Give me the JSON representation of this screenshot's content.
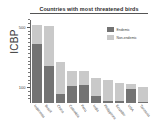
{
  "source": {
    "label": "ICBP"
  },
  "chart_data": {
    "type": "bar",
    "title": "Countries with most threatened birds",
    "xlabel": "",
    "ylabel": "",
    "ylim": [
      0,
      550
    ],
    "yticks": [
      100,
      500
    ],
    "ytick_labels": [
      "100",
      "500"
    ],
    "grid": false,
    "stacked": true,
    "legend_position": "top-right",
    "categories": [
      "Indonesia",
      "Brazil",
      "China",
      "Colombia",
      "Peru",
      "India",
      "Philippines",
      "Ecuador",
      "USA",
      "Tanzania"
    ],
    "series": [
      {
        "name": "Endemic",
        "color": "#737373",
        "values": [
          390,
          245,
          60,
          110,
          120,
          45,
          12,
          15,
          95,
          5
        ]
      },
      {
        "name": "Non-endemic",
        "color": "#c9c9c9",
        "values": [
          130,
          265,
          215,
          100,
          95,
          120,
          140,
          120,
          30,
          100
        ]
      }
    ],
    "totals": [
      520,
      510,
      275,
      210,
      215,
      165,
      152,
      135,
      125,
      105
    ],
    "annotations": []
  },
  "legend": {
    "items": [
      {
        "label": "Endemic",
        "color": "#737373"
      },
      {
        "label": "Non-endemic",
        "color": "#c9c9c9"
      }
    ]
  }
}
